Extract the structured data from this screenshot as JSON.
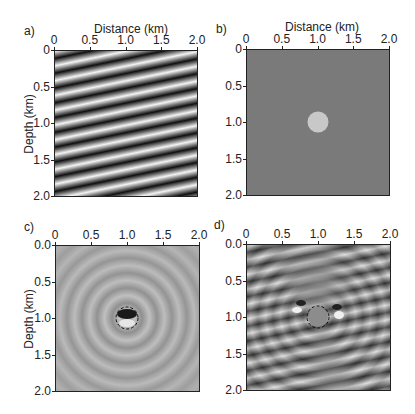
{
  "chart_data": [
    {
      "panel": "a)",
      "type": "heatmap",
      "title": "",
      "xlabel": "Distance (km)",
      "ylabel": "Depth (km)",
      "xticks": [
        "0",
        "0.5",
        "1.0",
        "1.5",
        "2.0"
      ],
      "yticks": [
        "0",
        "0.5",
        "1.0",
        "1.5",
        "2.0"
      ],
      "xlim": [
        0,
        2.0
      ],
      "ylim": [
        2.0,
        0
      ],
      "description": "Dipping plane-wave stripes (alternating black/white), about 10 cycles over 2 km depth, dipping down to the right"
    },
    {
      "panel": "b)",
      "type": "heatmap",
      "title": "",
      "xlabel": "Distance (km)",
      "ylabel": "",
      "xticks": [
        "0",
        "0.5",
        "1.0",
        "1.5",
        "2.0"
      ],
      "yticks": [
        "0",
        "0.5",
        "1.0",
        "1.5",
        "2.0"
      ],
      "xlim": [
        0,
        2.0
      ],
      "ylim": [
        2.0,
        0
      ],
      "description": "Uniform gray background with a light circular anomaly centered at (1.0 km, 1.0 km), radius about 0.1 km"
    },
    {
      "panel": "c)",
      "type": "heatmap",
      "title": "",
      "xlabel": "",
      "ylabel": "Depth (km)",
      "xticks": [
        "0",
        "0.5",
        "1.0",
        "1.5",
        "2.0"
      ],
      "yticks": [
        "0.0",
        "0.5",
        "1.0",
        "1.5",
        "2.0"
      ],
      "xlim": [
        0,
        2.0
      ],
      "ylim": [
        2.0,
        0
      ],
      "description": "Concentric circular wavefronts scattered from the anomaly at (1.0, 1.0); dashed circle outlines the anomaly"
    },
    {
      "panel": "d)",
      "type": "heatmap",
      "title": "",
      "xlabel": "",
      "ylabel": "",
      "xticks": [
        "0",
        "0.5",
        "1.0",
        "1.5",
        "2.0"
      ],
      "yticks": [
        "0.0",
        "0.5",
        "1.0",
        "1.5",
        "2.0"
      ],
      "xlim": [
        0,
        2.0
      ],
      "ylim": [
        2.0,
        0
      ],
      "description": "Total wavefield: dipping plane-wave stripes interfering with scattered field around the anomaly at (1.0, 1.0); dashed circle outlines the anomaly"
    }
  ],
  "panels": {
    "a": {
      "label": "a)",
      "xlabel": "Distance (km)",
      "ylabel": "Depth (km)",
      "xticks": [
        "0",
        "0.5",
        "1.0",
        "1.5",
        "2.0"
      ],
      "yticks": [
        "0",
        "0.5",
        "1.0",
        "1.5",
        "2.0"
      ]
    },
    "b": {
      "label": "b)",
      "xlabel": "Distance (km)",
      "xticks": [
        "0",
        "0.5",
        "1.0",
        "1.5",
        "2.0"
      ],
      "yticks": [
        "0",
        "0.5",
        "1.0",
        "1.5",
        "2.0"
      ]
    },
    "c": {
      "label": "c)",
      "ylabel": "Depth (km)",
      "xticks": [
        "0",
        "0.5",
        "1.0",
        "1.5",
        "2.0"
      ],
      "yticks": [
        "0.0",
        "0.5",
        "1.0",
        "1.5",
        "2.0"
      ]
    },
    "d": {
      "label": "d)",
      "xticks": [
        "0",
        "0.5",
        "1.0",
        "1.5",
        "2.0"
      ],
      "yticks": [
        "0.0",
        "0.5",
        "1.0",
        "1.5",
        "2.0"
      ]
    }
  },
  "colors": {
    "background_gray": "#7a7a7a",
    "anomaly": "#c8c8c8",
    "scatter_bg": "#a8a8a8"
  }
}
